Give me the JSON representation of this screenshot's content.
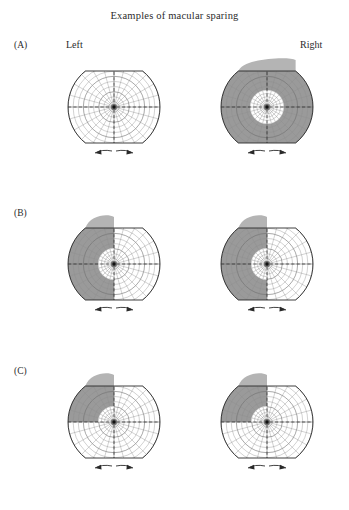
{
  "figure": {
    "title": "Examples of macular sparing",
    "column_labels": {
      "left": "Left",
      "right": "Right"
    },
    "panel_labels": {
      "a": "(A)",
      "b": "(B)",
      "c": "(C)"
    }
  },
  "colors": {
    "background": "#ffffff",
    "deficit_shading": "#9a9a9a",
    "deficit_shading_light": "#b4b4b4",
    "grid_line": "#6f6f6f",
    "grid_line_fine": "#8d8d8d",
    "outline": "#2a2a2a",
    "fovea": "#111111",
    "text": "#2b2b2b"
  },
  "chart_data": {
    "type": "diagram",
    "title": "Examples of macular sparing",
    "grid": {
      "radial_spokes": 24,
      "concentric_rings": 9,
      "meridians": [
        "horizontal",
        "vertical"
      ],
      "meridian_style": "dashed",
      "top_chord": true,
      "bottom_chord": true,
      "fovea_marker": true,
      "bottom_arrows": 2
    },
    "panels": [
      {
        "row": "(A)",
        "eye": "Left",
        "deficit": "none",
        "deficit_extent_deg": 0,
        "macular_sparing": false,
        "sparing_radius_px": 0,
        "shaded": false
      },
      {
        "row": "(A)",
        "eye": "Right",
        "deficit": "complete field loss",
        "deficit_extent_deg": 360,
        "macular_sparing": true,
        "sparing_shape": "full circle",
        "sparing_radius_px": 17,
        "shaded": true
      },
      {
        "row": "(B)",
        "eye": "Left",
        "deficit": "left homonymous hemianopia",
        "deficit_extent_deg": 180,
        "deficit_half": "left",
        "macular_sparing": true,
        "sparing_shape": "half circle",
        "sparing_radius_px": 16,
        "shaded": true
      },
      {
        "row": "(B)",
        "eye": "Right",
        "deficit": "left homonymous hemianopia",
        "deficit_extent_deg": 180,
        "deficit_half": "left",
        "macular_sparing": true,
        "sparing_shape": "half circle",
        "sparing_radius_px": 16,
        "shaded": true
      },
      {
        "row": "(C)",
        "eye": "Left",
        "deficit": "upper left quadrantanopia",
        "deficit_extent_deg": 90,
        "deficit_quadrant": "upper-left",
        "macular_sparing": true,
        "sparing_shape": "quarter circle",
        "sparing_radius_px": 16,
        "shaded": true
      },
      {
        "row": "(C)",
        "eye": "Right",
        "deficit": "upper left quadrantanopia",
        "deficit_extent_deg": 90,
        "deficit_quadrant": "upper-left",
        "macular_sparing": true,
        "sparing_shape": "quarter circle",
        "sparing_radius_px": 16,
        "shaded": true
      }
    ],
    "layout": {
      "rows": 3,
      "columns": 2,
      "row_tops_px": [
        55,
        212,
        370
      ],
      "column_lefts_px": [
        66,
        219
      ]
    }
  }
}
